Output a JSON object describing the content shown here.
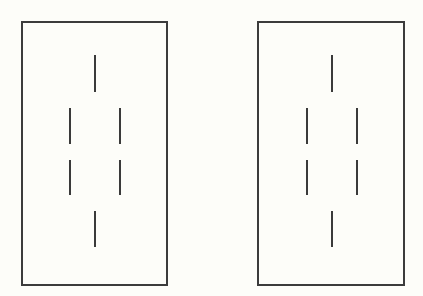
{
  "figure": {
    "background": "#fdfdf9",
    "stroke_color": "#3a3a3a",
    "panels": [
      {
        "id": "left",
        "box": {
          "x": 21,
          "y": 21,
          "w": 147,
          "h": 265
        },
        "segments": [
          {
            "x": 95,
            "y1": 55,
            "y2": 92
          },
          {
            "x": 70,
            "y1": 108,
            "y2": 144
          },
          {
            "x": 120,
            "y1": 108,
            "y2": 144
          },
          {
            "x": 70,
            "y1": 160,
            "y2": 195
          },
          {
            "x": 120,
            "y1": 160,
            "y2": 195
          },
          {
            "x": 95,
            "y1": 211,
            "y2": 247
          }
        ]
      },
      {
        "id": "right",
        "box": {
          "x": 257,
          "y": 21,
          "w": 148,
          "h": 265
        },
        "segments": [
          {
            "x": 332,
            "y1": 55,
            "y2": 92
          },
          {
            "x": 307,
            "y1": 108,
            "y2": 144
          },
          {
            "x": 357,
            "y1": 108,
            "y2": 144
          },
          {
            "x": 307,
            "y1": 160,
            "y2": 195
          },
          {
            "x": 357,
            "y1": 160,
            "y2": 195
          },
          {
            "x": 332,
            "y1": 211,
            "y2": 247
          }
        ]
      }
    ]
  }
}
